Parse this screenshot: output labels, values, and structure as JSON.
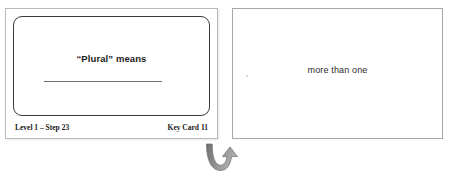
{
  "worksheet": {
    "question_card": {
      "prompt": "“Plural” means",
      "answer_blank_label": "answer-blank-line",
      "footer_left": "Level 1 – Step 23",
      "footer_right": "Key Card 11"
    },
    "answer_card": {
      "answer": "more than one"
    },
    "flip_arrow": {
      "icon": "curved-flip-arrow-icon"
    },
    "colors": {
      "page_background": "#ffffff",
      "card_background": "#ffffff",
      "inner_card_border": "#3a3a3a",
      "outer_card_border": "#b9b9b9",
      "answer_card_border": "#a8a8a8",
      "prompt_text": "#1d1d1d",
      "answer_text": "#2a2a2a",
      "footer_text": "#1a1a1a",
      "blank_line": "#6e6e6e",
      "arrow_fill": "#8a8a8a"
    }
  }
}
